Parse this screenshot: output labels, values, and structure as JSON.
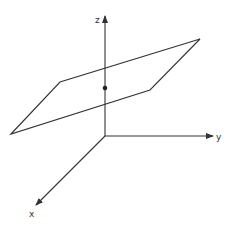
{
  "diagram": {
    "title": "",
    "axes": {
      "z": {
        "label": "z"
      },
      "y": {
        "label": "y"
      },
      "x": {
        "label": "x"
      }
    },
    "elements": [
      "three orthogonal coordinate axes (x, y, z) meeting at origin",
      "parallelogram representing a plane",
      "point on z-axis where it intersects the plane"
    ],
    "colors": {
      "stroke": "#333333",
      "background": "#ffffff"
    }
  }
}
